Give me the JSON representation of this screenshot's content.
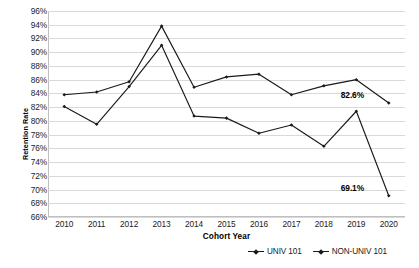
{
  "chart_data": {
    "type": "line",
    "title": "",
    "xlabel": "Cohort Year",
    "ylabel": "Retention Rate",
    "categories": [
      "2010",
      "2011",
      "2012",
      "2013",
      "2014",
      "2015",
      "2016",
      "2017",
      "2018",
      "2019",
      "2020"
    ],
    "ylim": [
      66,
      96
    ],
    "ytick_step": 2,
    "ytick_labels": [
      "96%",
      "94%",
      "92%",
      "90%",
      "88%",
      "86%",
      "84%",
      "82%",
      "80%",
      "78%",
      "76%",
      "74%",
      "72%",
      "70%",
      "68%",
      "66%"
    ],
    "grid": true,
    "legend_position": "bottom-right",
    "series": [
      {
        "name": "UNIV 101",
        "marker": "diamond",
        "color": "#1a1a1a",
        "values": [
          83.8,
          84.2,
          85.7,
          93.8,
          84.9,
          86.4,
          86.8,
          83.8,
          85.1,
          86.0,
          82.6
        ]
      },
      {
        "name": "NON-UNIV 101",
        "marker": "diamond",
        "color": "#1a1a1a",
        "values": [
          82.1,
          79.5,
          85.0,
          91.0,
          80.7,
          80.4,
          78.2,
          79.4,
          76.3,
          81.4,
          69.1
        ]
      }
    ],
    "annotations": [
      {
        "text": "82.6%",
        "series": "UNIV 101",
        "category": "2020",
        "value": 82.6
      },
      {
        "text": "69.1%",
        "series": "NON-UNIV 101",
        "category": "2020",
        "value": 69.1
      }
    ]
  }
}
